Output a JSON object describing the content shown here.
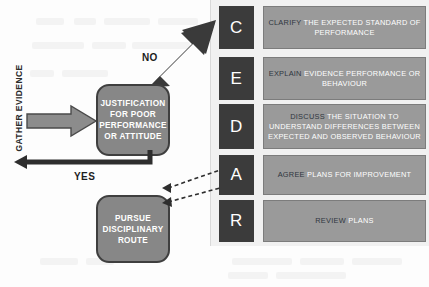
{
  "diagram": {
    "colors": {
      "letter_box": "#3b3b3b",
      "text_box": "#9a9a9a",
      "process_box": "#878787",
      "panel": "#f1f1f1",
      "keyword": "#2f3640",
      "body_text": "#ffffff",
      "arrow_dark": "#3a3a3a",
      "arrow_gray": "#8c8c8c"
    },
    "flow": {
      "entry_label": "GATHER EVIDENCE",
      "decision": {
        "name": "justification-box",
        "lines": [
          "JUSTIFICATION",
          "FOR POOR",
          "PERFORMANCE",
          "OR ATTITUDE"
        ]
      },
      "branch_no": "NO",
      "branch_yes": "YES",
      "outcome": {
        "name": "pursue-disciplinary-box",
        "lines": [
          "PURSUE",
          "DISCIPLINARY",
          "ROUTE"
        ]
      }
    },
    "cedar": [
      {
        "letter": "C",
        "keyword": "CLARIFY",
        "rest": " THE EXPECTED STANDARD OF PERFORMANCE",
        "full": "CLARIFY THE EXPECTED STANDARD OF PERFORMANCE"
      },
      {
        "letter": "E",
        "keyword": "EXPLAIN",
        "rest": " EVIDENCE PERFORMANCE OR BEHAVIOUR",
        "full": "EXPLAIN EVIDENCE PERFORMANCE OR BEHAVIOUR"
      },
      {
        "letter": "D",
        "keyword": "DISCUSS",
        "rest": " THE SITUATION TO UNDERSTAND DIFFERENCES BETWEEN EXPECTED AND OBSERVED BEHAVIOUR",
        "full": "DISCUSS THE SITUATION TO UNDERSTAND DIFFERENCES BETWEEN EXPECTED AND OBSERVED BEHAVIOUR"
      },
      {
        "letter": "A",
        "keyword": "AGREE",
        "rest": " PLANS FOR IMPROVEMENT",
        "full": "AGREE PLANS FOR IMPROVEMENT"
      },
      {
        "letter": "R",
        "keyword": "REVIEW",
        "rest": " PLANS",
        "full": "REVIEW PLANS"
      }
    ]
  }
}
